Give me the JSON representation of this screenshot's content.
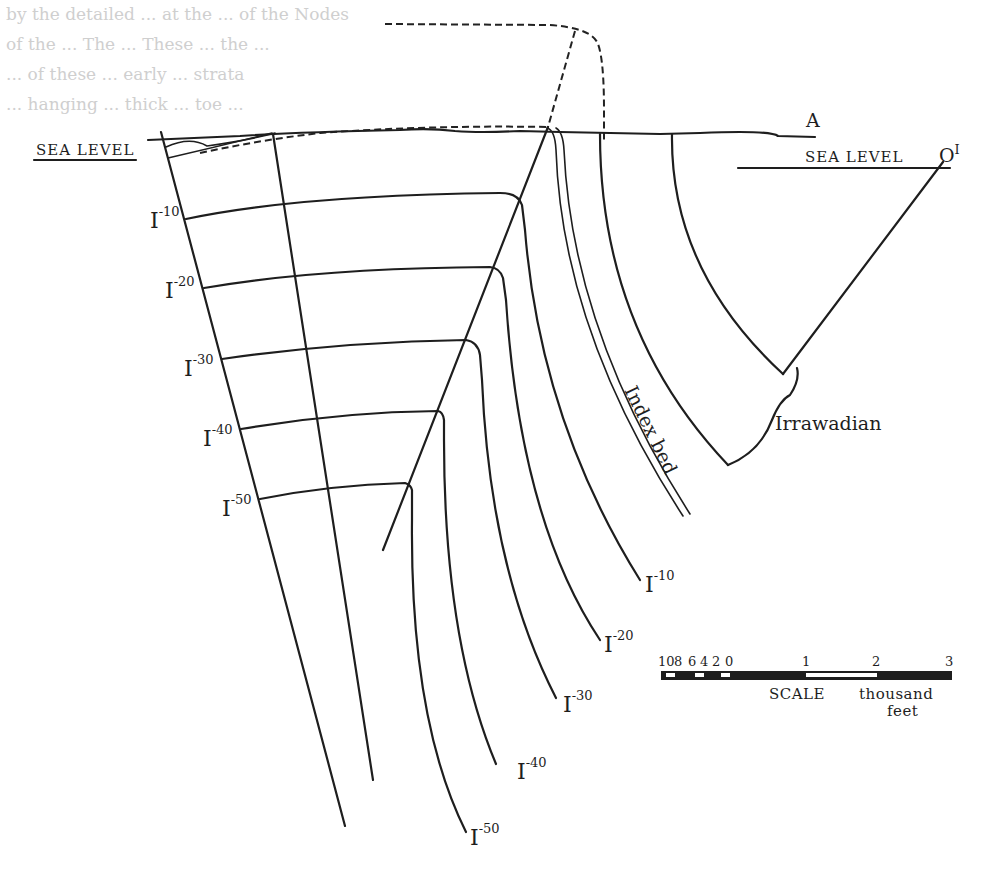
{
  "figure": {
    "type": "geological cross-section",
    "background_text_faint": [
      "by the detailed ... at the ... of the Nodes",
      "of the ... The ... These ... the ...",
      "... of these ... early ... strata",
      "... hanging ... thick ... toe ..."
    ],
    "labels": {
      "sea_level_left": "SEA LEVEL",
      "sea_level_right": "SEA LEVEL",
      "point_a": "A",
      "point_o": "O",
      "point_o_sup": "I",
      "formation": "Irrawadian",
      "index_bed": "Index bed"
    },
    "isopachs_left": [
      {
        "base": "I",
        "sup": "-10"
      },
      {
        "base": "I",
        "sup": "-20"
      },
      {
        "base": "I",
        "sup": "-30"
      },
      {
        "base": "I",
        "sup": "-40"
      },
      {
        "base": "I",
        "sup": "-50"
      }
    ],
    "isopachs_bottom": [
      {
        "base": "I",
        "sup": "-10"
      },
      {
        "base": "I",
        "sup": "-20"
      },
      {
        "base": "I",
        "sup": "-30"
      },
      {
        "base": "I",
        "sup": "-40"
      },
      {
        "base": "I",
        "sup": "-50"
      }
    ],
    "scale_bar": {
      "ticks_left": [
        "10",
        "8",
        "6",
        "4",
        "2",
        "0"
      ],
      "ticks_right": [
        "1",
        "2",
        "3"
      ],
      "label": "SCALE",
      "unit_line1": "thousand",
      "unit_line2": "feet"
    },
    "colors": {
      "ink": "#1e1e1e",
      "paper": "#ffffff",
      "ghost": "#cfcfcf"
    }
  }
}
